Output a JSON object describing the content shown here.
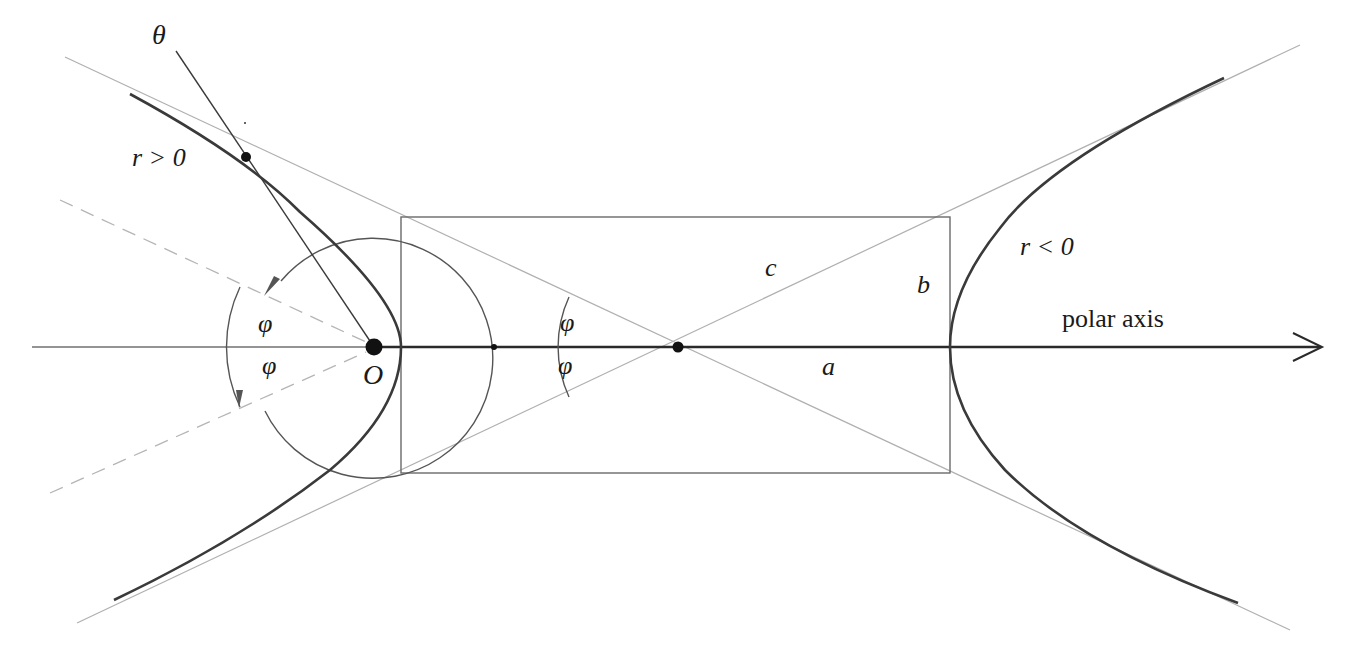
{
  "diagram": {
    "colors": {
      "background": "#ffffff",
      "curve": "#3a3a3a",
      "axis": "#2a2a2a",
      "asymptote": "#b0b0b0",
      "rectangle": "#6a6a6a",
      "circle": "#555555",
      "dashed": "#b5b5b5",
      "point": "#111111"
    },
    "labels": {
      "theta": "θ",
      "r_positive": "r > 0",
      "r_negative": "r < 0",
      "phi_left_upper": "φ",
      "phi_left_lower": "φ",
      "phi_center_upper": "φ",
      "phi_center_lower": "φ",
      "origin": "O",
      "c": "c",
      "b": "b",
      "a": "a",
      "polar_axis": "polar axis"
    },
    "geometry": {
      "axis_y": 347,
      "focus_O": [
        374,
        347
      ],
      "center": [
        678,
        347
      ],
      "vertex_left": [
        401,
        347
      ],
      "vertex_right": [
        950,
        347
      ],
      "rectangle": {
        "x": 401,
        "y": 217,
        "width": 549,
        "height": 256
      },
      "circle_center": [
        374,
        347
      ],
      "circle_radius": 120,
      "point_on_curve": [
        246,
        157
      ]
    }
  }
}
